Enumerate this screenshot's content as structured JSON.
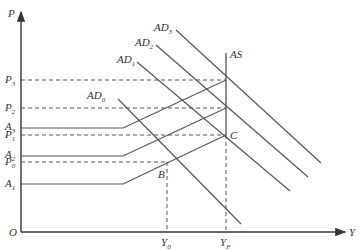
{
  "diagram": {
    "colors": {
      "line": "#555555",
      "axis": "#333333",
      "dash": "#555555",
      "background": "#ffffff"
    },
    "axes": {
      "y_label": "P",
      "x_label": "Y",
      "origin_label": "O"
    },
    "price_levels": [
      {
        "base": "P",
        "sub": "3",
        "y": 80
      },
      {
        "base": "P",
        "sub": "2",
        "y": 108
      },
      {
        "base": "P",
        "sub": "1",
        "y": 135
      },
      {
        "base": "P",
        "sub": "0",
        "y": 162
      }
    ],
    "supply_curve_labels": [
      {
        "base": "A",
        "sub": "3",
        "y": 128
      },
      {
        "base": "A",
        "sub": "2",
        "y": 156
      },
      {
        "base": "A",
        "sub": "1",
        "y": 184
      }
    ],
    "output_levels": [
      {
        "base": "Y",
        "sub": "0",
        "x": 167
      },
      {
        "base": "Y",
        "sub": "F",
        "x": 226
      }
    ],
    "demand_curves": [
      {
        "base": "AD",
        "sub": "0"
      },
      {
        "base": "AD",
        "sub": "1"
      },
      {
        "base": "AD",
        "sub": "2"
      },
      {
        "base": "AD",
        "sub": "3"
      }
    ],
    "as_label": "AS",
    "points": [
      {
        "label": "B"
      },
      {
        "label": "C"
      }
    ]
  }
}
